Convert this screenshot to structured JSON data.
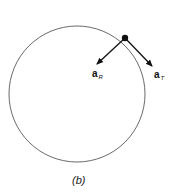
{
  "figure": {
    "caption": "(b)",
    "vectors": [
      {
        "name": "a",
        "subscript": "R",
        "meaning": "radial acceleration"
      },
      {
        "name": "a",
        "subscript": "T",
        "meaning": "tangential acceleration"
      }
    ]
  },
  "colors": {
    "stroke": "#111111",
    "circle": "#444444"
  }
}
